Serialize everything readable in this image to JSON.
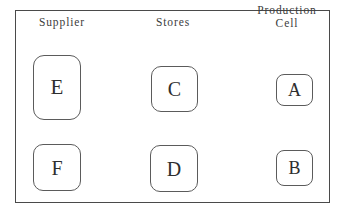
{
  "diagram": {
    "frame": {
      "stroke_color": "#4a4a4a",
      "fill_color": "#ffffff"
    },
    "columns": [
      {
        "id": "supplier",
        "label": "Supplier",
        "label_lines": [
          "Supplier"
        ]
      },
      {
        "id": "stores",
        "label": "Stores",
        "label_lines": [
          "Stores"
        ]
      },
      {
        "id": "production-cell",
        "label": "Production Cell",
        "label_lines": [
          "Production",
          "Cell"
        ]
      }
    ],
    "nodes": [
      {
        "id": "e",
        "label": "E",
        "column": "supplier",
        "row": "top",
        "shape": "rounded-rectangle"
      },
      {
        "id": "f",
        "label": "F",
        "column": "supplier",
        "row": "bottom",
        "shape": "rounded-rectangle"
      },
      {
        "id": "c",
        "label": "C",
        "column": "stores",
        "row": "top",
        "shape": "rounded-rectangle"
      },
      {
        "id": "d",
        "label": "D",
        "column": "stores",
        "row": "bottom",
        "shape": "rounded-rectangle"
      },
      {
        "id": "a",
        "label": "A",
        "column": "production-cell",
        "row": "top",
        "shape": "rounded-rectangle"
      },
      {
        "id": "b",
        "label": "B",
        "column": "production-cell",
        "row": "bottom",
        "shape": "rounded-rectangle"
      }
    ],
    "colors": {
      "node_stroke": "#5b5b5b",
      "node_fill": "#ffffff",
      "text": "#2e2e2e",
      "label_text": "#3c3c3c",
      "background": "#ffffff"
    }
  }
}
